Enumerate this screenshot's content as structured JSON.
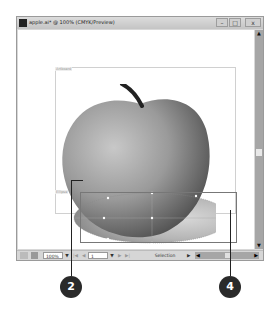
{
  "window": {
    "title": "apple.ai* @ 100% (CMYK/Preview)",
    "buttons": {
      "minimize": "–",
      "maximize": "□",
      "close": "x"
    }
  },
  "canvas": {
    "artboard_label": "Artboard",
    "selection_label": "Ellipse"
  },
  "statusbar": {
    "zoom_value": "100%",
    "page_value": "1",
    "tool_status": "Selection",
    "dropdown_arrow": "▼",
    "nav_prev_first": "|◀",
    "nav_prev": "◀",
    "nav_next": "▶",
    "nav_next_last": "▶|"
  },
  "scrollbars": {
    "up": "▲",
    "down": "▼",
    "left": "◀",
    "right": "▶"
  },
  "callouts": [
    {
      "number": "2"
    },
    {
      "number": "4"
    }
  ],
  "colors": {
    "callout_bg": "#2a2a2a",
    "scrollbar": "#a6a6a6",
    "titlebar": "#d0d0d0"
  }
}
